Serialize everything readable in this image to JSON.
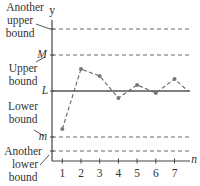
{
  "chart_data": {
    "type": "line",
    "title": "",
    "xlabel": "n",
    "ylabel": "y",
    "x": [
      1,
      2,
      3,
      4,
      5,
      6,
      7
    ],
    "x_tick_labels": [
      "1",
      "2",
      "3",
      "4",
      "5",
      "6",
      "7"
    ],
    "series": [
      {
        "name": "sequence",
        "style": "dashed-with-dots",
        "values": [
          3.2,
          9.2,
          8.5,
          6.3,
          7.6,
          6.8,
          8.2
        ]
      }
    ],
    "reference_lines": [
      {
        "label": "Another upper bound",
        "symbol": "",
        "value": 13.2,
        "style": "dashed"
      },
      {
        "label": "Upper bound",
        "symbol": "M",
        "value": 10.6,
        "style": "dashed"
      },
      {
        "label": "",
        "symbol": "L",
        "value": 7.0,
        "style": "solid"
      },
      {
        "label": "Lower bound",
        "symbol": "m",
        "value": 2.4,
        "style": "dashed"
      },
      {
        "label": "Another lower bound",
        "symbol": "",
        "value": 1.0,
        "style": "dashed"
      }
    ],
    "ylim": [
      0,
      14.5
    ],
    "xlim": [
      0,
      7.7
    ],
    "grid": false,
    "legend": "none"
  },
  "labels": {
    "y_axis": "y",
    "x_axis": "n",
    "another_upper_line1": "Another",
    "another_upper_line2": "upper",
    "another_upper_line3": "bound",
    "upper_line1": "Upper",
    "upper_line2": "bound",
    "M": "M",
    "L": "L",
    "lower_line1": "Lower",
    "lower_line2": "bound",
    "m": "m",
    "another_lower_line1": "Another",
    "another_lower_line2": "lower",
    "another_lower_line3": "bound",
    "ticks": [
      "1",
      "2",
      "3",
      "4",
      "5",
      "6",
      "7"
    ]
  }
}
